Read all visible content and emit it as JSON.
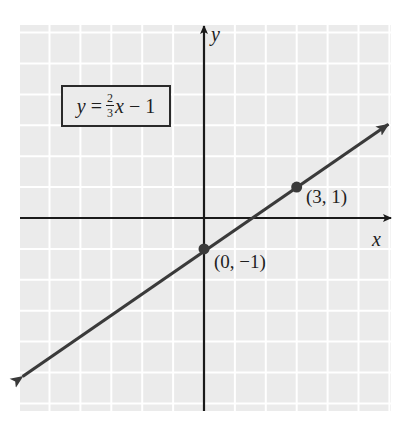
{
  "chart_data": {
    "type": "line",
    "title": "",
    "equation": "y = (2/3)x - 1",
    "equation_display": {
      "lhs": "y",
      "equals": "=",
      "frac_num": "2",
      "frac_den": "3",
      "var": "x",
      "rest": "− 1"
    },
    "xlabel": "x",
    "ylabel": "y",
    "xlim": [
      -6,
      6
    ],
    "ylim": [
      -6.25,
      6.25
    ],
    "grid": true,
    "grid_step": 1,
    "tick_labels_shown": false,
    "series": [
      {
        "name": "y = (2/3)x - 1",
        "x": [
          -6,
          6
        ],
        "y": [
          -5,
          3
        ],
        "color": "#3a3a3a",
        "arrows_both_ends": true
      }
    ],
    "points": [
      {
        "x": 0,
        "y": -1,
        "label": "(0, −1)"
      },
      {
        "x": 3,
        "y": 1,
        "label": "(3, 1)"
      }
    ],
    "colors": {
      "grid_background": "#ebebeb",
      "grid_lines": "#ffffff",
      "axes": "#1a1a1a",
      "line": "#3a3a3a",
      "points": "#3a3a3a"
    }
  }
}
